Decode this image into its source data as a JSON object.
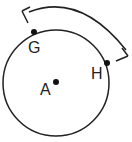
{
  "figure": {
    "circle": {
      "center_label": "A",
      "stroke": "#222222"
    },
    "points": [
      {
        "label": "G"
      },
      {
        "label": "H"
      },
      {
        "label": "A"
      }
    ],
    "arc_arrow": {
      "from": "G",
      "to": "H",
      "double_headed": true
    }
  }
}
